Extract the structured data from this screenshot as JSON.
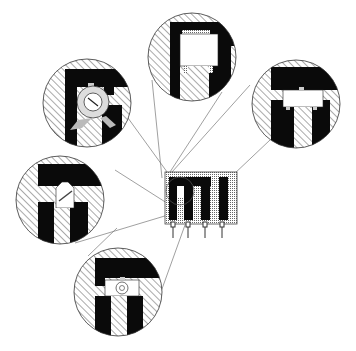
{
  "diagram": {
    "type": "technical-cross-section",
    "colors": {
      "background": "#ffffff",
      "solid": "#0a0a0a",
      "hatch": "#555555",
      "outline": "#333333",
      "leader": "#666666",
      "insert_fill": "#ffffff",
      "rotor_fill": "#cfcfcf"
    },
    "component": {
      "x": 165,
      "y": 172,
      "width": 72,
      "height": 52,
      "pin_count": 4
    },
    "details": [
      {
        "id": "top",
        "cx": 192,
        "cy": 57,
        "r": 45,
        "variant": "square-insert"
      },
      {
        "id": "upper-left",
        "cx": 87,
        "cy": 103,
        "r": 45,
        "variant": "rotary-screw"
      },
      {
        "id": "right",
        "cx": 296,
        "cy": 104,
        "r": 45,
        "variant": "wide-insert"
      },
      {
        "id": "left",
        "cx": 60,
        "cy": 200,
        "r": 45,
        "variant": "slanted-slot"
      },
      {
        "id": "bottom",
        "cx": 118,
        "cy": 292,
        "r": 45,
        "variant": "round-dial"
      }
    ]
  }
}
